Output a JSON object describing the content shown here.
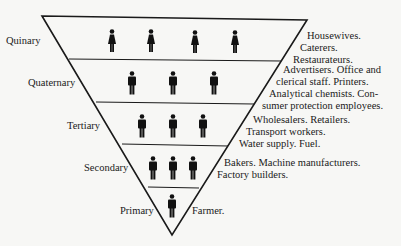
{
  "diagram": {
    "type": "inverted-pyramid",
    "colors": {
      "line": "#1a1a1a",
      "figure": "#111111",
      "background": "#f7f7f5"
    },
    "levels": [
      {
        "sector": "Quinary",
        "figures": 4,
        "figure_type": "female-icon",
        "examples": [
          "Housewives.",
          "Caterers.",
          "Restaurateurs."
        ]
      },
      {
        "sector": "Quaternary",
        "figures": 3,
        "figure_type": "male-icon",
        "examples": [
          "Advertisers. Office and",
          "clerical staff. Printers.",
          "Analytical chemists. Con-",
          "sumer protection employees."
        ]
      },
      {
        "sector": "Tertiary",
        "figures": 3,
        "figure_type": "male-icon",
        "examples": [
          "Wholesalers. Retailers.",
          "Transport workers.",
          "Water supply. Fuel."
        ]
      },
      {
        "sector": "Secondary",
        "figures": 3,
        "figure_type": "male-icon",
        "examples": [
          "Bakers. Machine manufacturers.",
          "Factory builders."
        ]
      },
      {
        "sector": "Primary",
        "figures": 1,
        "figure_type": "male-icon",
        "examples": [
          "Farmer."
        ]
      }
    ]
  }
}
